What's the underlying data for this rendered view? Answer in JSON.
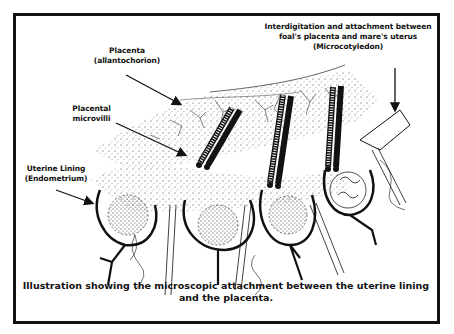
{
  "labels": {
    "microcotyledon": {
      "line1": "Interdigitation and attachment between",
      "line2": "foal's placenta and mare's uterus",
      "line3": "(Microcotyledon)"
    },
    "placenta": {
      "line1": "Placenta",
      "line2": "(allantochorion)"
    },
    "microvilli": {
      "line1": "Placental",
      "line2": "microvilli"
    },
    "uterine_lining": {
      "line1": "Uterine Lining",
      "line2": "(Endometrium)"
    }
  },
  "caption": {
    "line1": "Illustration showing the microscopic attachment between the uterine lining",
    "line2": "and the placenta."
  },
  "colors": {
    "ink": "#111111",
    "background": "#ffffff"
  }
}
